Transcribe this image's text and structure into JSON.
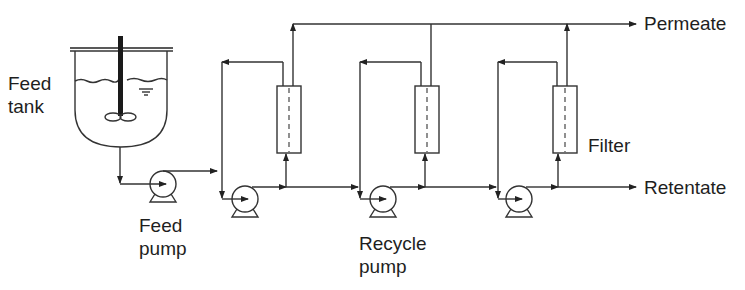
{
  "diagram": {
    "labels": {
      "feed_tank_line1": "Feed",
      "feed_tank_line2": "tank",
      "feed_pump_line1": "Feed",
      "feed_pump_line2": "pump",
      "recycle_pump_line1": "Recycle",
      "recycle_pump_line2": "pump",
      "filter": "Filter",
      "permeate": "Permeate",
      "retentate": "Retentate"
    },
    "components": [
      {
        "id": "feed-tank",
        "type": "stirred tank"
      },
      {
        "id": "feed-pump",
        "type": "pump"
      },
      {
        "id": "stage-1",
        "type": "recycle loop",
        "pump": "recycle pump",
        "filter": "filter module"
      },
      {
        "id": "stage-2",
        "type": "recycle loop",
        "pump": "recycle pump",
        "filter": "filter module"
      },
      {
        "id": "stage-3",
        "type": "recycle loop",
        "pump": "recycle pump",
        "filter": "filter module"
      }
    ],
    "streams": [
      {
        "from": "feed-tank",
        "to": "feed-pump"
      },
      {
        "from": "feed-pump",
        "to": "stage-1"
      },
      {
        "from": "stage-1",
        "to": "stage-2"
      },
      {
        "from": "stage-2",
        "to": "stage-3"
      },
      {
        "from": "stage-3",
        "to": "Retentate"
      },
      {
        "from": "filters",
        "to": "Permeate"
      }
    ],
    "colors": {
      "line": "#333333",
      "text": "#1e1e1e",
      "background": "#ffffff"
    }
  }
}
